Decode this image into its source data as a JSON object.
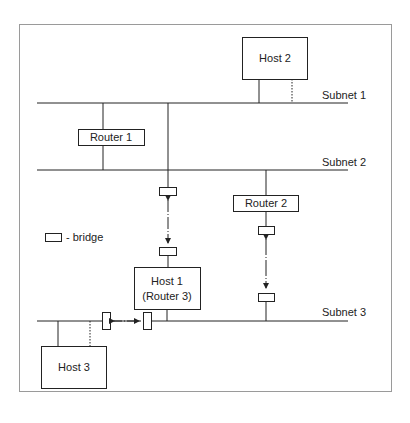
{
  "diagram": {
    "type": "network-topology",
    "subnets": [
      {
        "id": "subnet1",
        "label": "Subnet 1"
      },
      {
        "id": "subnet2",
        "label": "Subnet 2"
      },
      {
        "id": "subnet3",
        "label": "Subnet 3"
      }
    ],
    "nodes": {
      "host2": {
        "label": "Host 2"
      },
      "router1": {
        "label": "Router 1"
      },
      "router2": {
        "label": "Router 2"
      },
      "host1": {
        "line1": "Host 1",
        "line2": "(Router 3)"
      },
      "host3": {
        "label": "Host 3"
      }
    },
    "legend": {
      "bridge_label": "- bridge"
    },
    "colors": {
      "line": "#222222",
      "frame": "#9a9a9a",
      "background": "#ffffff"
    }
  }
}
